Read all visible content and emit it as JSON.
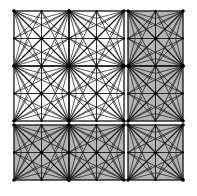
{
  "figure": {
    "canvas": {
      "width": 197,
      "height": 196
    },
    "colors": {
      "background": "#ffffff",
      "shaded_fill": "#b4b4b4",
      "unshaded_fill": "#ffffff",
      "mesh_line": "#1a1a1a",
      "block_border": "#111111",
      "node_dot": "#000000"
    },
    "grid": {
      "columns": 3,
      "rows": 3,
      "origin_x": 14,
      "origin_y": 11,
      "block_size": 55,
      "gap": 4,
      "sub_divisions": 2,
      "fan_rays": 5
    },
    "blocks": [
      {
        "id": "block-r1c1",
        "row": 1,
        "col": 1,
        "shaded": false
      },
      {
        "id": "block-r1c2",
        "row": 1,
        "col": 2,
        "shaded": false
      },
      {
        "id": "block-r1c3",
        "row": 1,
        "col": 3,
        "shaded": true
      },
      {
        "id": "block-r2c1",
        "row": 2,
        "col": 1,
        "shaded": false
      },
      {
        "id": "block-r2c2",
        "row": 2,
        "col": 2,
        "shaded": false
      },
      {
        "id": "block-r2c3",
        "row": 2,
        "col": 3,
        "shaded": true
      },
      {
        "id": "block-r3c1",
        "row": 3,
        "col": 1,
        "shaded": true
      },
      {
        "id": "block-r3c2",
        "row": 3,
        "col": 2,
        "shaded": true
      },
      {
        "id": "block-r3c3",
        "row": 3,
        "col": 3,
        "shaded": true
      }
    ],
    "merged_region": {
      "name": "unshaded-quadrant",
      "rows": [
        1,
        2
      ],
      "cols": [
        1,
        2
      ],
      "no_internal_gap": true
    }
  }
}
